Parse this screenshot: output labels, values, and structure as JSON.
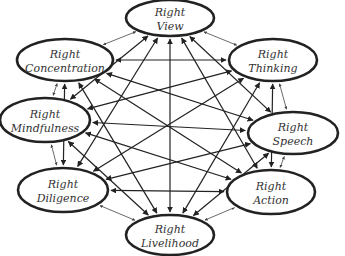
{
  "diagram": {
    "colors": {
      "stroke": "#222222",
      "fill": "#ffffff",
      "text": "#333333"
    },
    "nodes": [
      {
        "id": "view",
        "line1": "Right",
        "line2": "View",
        "cx": 170,
        "cy": 18,
        "rx": 44,
        "ry": 18
      },
      {
        "id": "thinking",
        "line1": "Right",
        "line2": "Thinking",
        "cx": 273,
        "cy": 60,
        "rx": 44,
        "ry": 21
      },
      {
        "id": "speech",
        "line1": "Right",
        "line2": "Speech",
        "cx": 293,
        "cy": 133,
        "rx": 45,
        "ry": 21
      },
      {
        "id": "action",
        "line1": "Right",
        "line2": "Action",
        "cx": 271,
        "cy": 192,
        "rx": 44,
        "ry": 22
      },
      {
        "id": "livelihood",
        "line1": "Right",
        "line2": "Livelihood",
        "cx": 170,
        "cy": 235,
        "rx": 44,
        "ry": 20
      },
      {
        "id": "diligence",
        "line1": "Right",
        "line2": "Diligence",
        "cx": 63,
        "cy": 190,
        "rx": 45,
        "ry": 22
      },
      {
        "id": "mindfulness",
        "line1": "Right",
        "line2": "Mindfulness",
        "cx": 45,
        "cy": 120,
        "rx": 45,
        "ry": 22
      },
      {
        "id": "concentration",
        "line1": "Right",
        "line2": "Concentration",
        "cx": 65,
        "cy": 60,
        "rx": 48,
        "ry": 21
      }
    ]
  }
}
